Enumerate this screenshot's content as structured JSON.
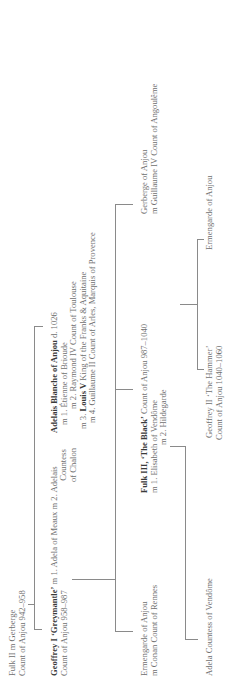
{
  "tree": {
    "fulk2": {
      "line1": "Fulk II m Gerberge",
      "line2": "Count of Anjou 942–958"
    },
    "geoffrey1": {
      "name": "Geoffrey I ‘Greymantle’",
      "marriage": " m 1. Adela of Meaux m 2. Adelais",
      "title": "Count of Anjou 958–987",
      "spouse2_line2": "Countess",
      "spouse2_line3": "of Chalon"
    },
    "adelais": {
      "name": "Adelais Blanche of Anjou",
      "death": " d. 1026",
      "m1": "m 1. Étienne of Brioude",
      "m2": "m 2. Raymond IV Count of Toulouse",
      "m3_prefix": "m 3. ",
      "m3_name": "Louis V",
      "m3_suffix": " King of the Franks & Aquitaine",
      "m4": "m 4. Guillaume II Count of Arles, Marquis of Provence"
    },
    "ermengarde_conan": {
      "line1": "Ermengarde of Anjou",
      "line2": "m Conan Count of Rennes"
    },
    "fulk3": {
      "name": "Fulk III, ‘The Black’",
      "title": " Count of Anjou 987–1040",
      "m1": "m 1. Elisabeth of Vendôme",
      "m2": "m 2. Hildegarde"
    },
    "gerberge": {
      "line1": "Gerberge of Anjou",
      "line2": "m Guillaume IV Count of Angoulême"
    },
    "adela": {
      "line1": "Adela Countess of Vendôme"
    },
    "geoffrey2": {
      "line1": "Geoffrey II ‘The Hammer’",
      "line2": "Count of Anjou 1040–1060"
    },
    "ermengarde2": {
      "line1": "Ermengarde of Anjou"
    }
  },
  "colors": {
    "text": "#6f6f6f",
    "bold_text": "#3a3a3a",
    "lines": "#8a8a8a",
    "background": "#ffffff"
  }
}
